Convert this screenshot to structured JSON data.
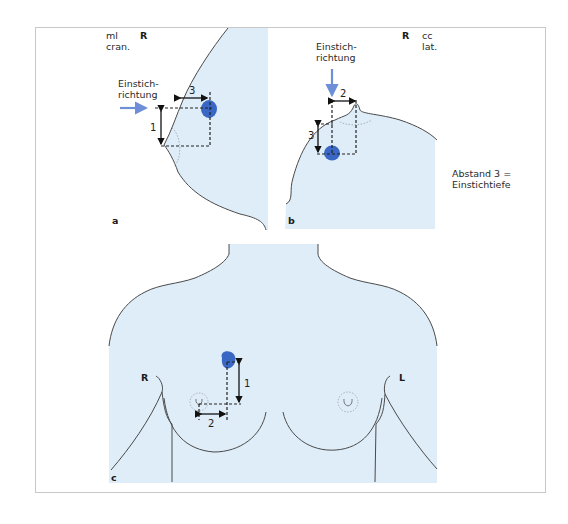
{
  "colors": {
    "tissue_fill": "#deedf8",
    "lesion": "#3a66c4",
    "needle_arrow": "#6e8fd8",
    "outline": "#4a4a4a",
    "frame": "#c8c8c8"
  },
  "panel_a": {
    "letter": "a",
    "projection_line1": "ml",
    "projection_line2": "cran.",
    "side": "R",
    "direction_label_line1": "Einstich-",
    "direction_label_line2": "richtung",
    "measure_1": "1",
    "measure_3": "3"
  },
  "panel_b": {
    "letter": "b",
    "projection_line1": "cc",
    "projection_line2": "lat.",
    "side": "R",
    "direction_label_line1": "Einstich-",
    "direction_label_line2": "richtung",
    "measure_2": "2",
    "measure_3": "3",
    "note_line1": "Abstand 3 =",
    "note_line2": "Einstichtiefe"
  },
  "panel_c": {
    "letter": "c",
    "side_right": "R",
    "side_left": "L",
    "measure_1": "1",
    "measure_2": "2"
  }
}
